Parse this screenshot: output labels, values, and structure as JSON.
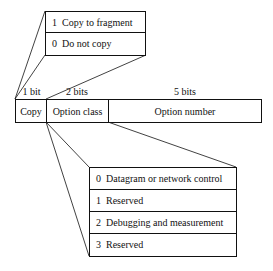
{
  "copy_values": [
    {
      "value": "1",
      "label": "Copy to fragment"
    },
    {
      "value": "0",
      "label": "Do not copy"
    }
  ],
  "option_field": {
    "bit_labels": [
      "1 bit",
      "2 bits",
      "5 bits"
    ],
    "fields": [
      "Copy",
      "Option class",
      "Option number"
    ]
  },
  "option_classes": [
    {
      "value": "0",
      "label": "Datagram or network control"
    },
    {
      "value": "1",
      "label": "Reserved"
    },
    {
      "value": "2",
      "label": "Debugging and measurement"
    },
    {
      "value": "3",
      "label": "Reserved"
    }
  ]
}
